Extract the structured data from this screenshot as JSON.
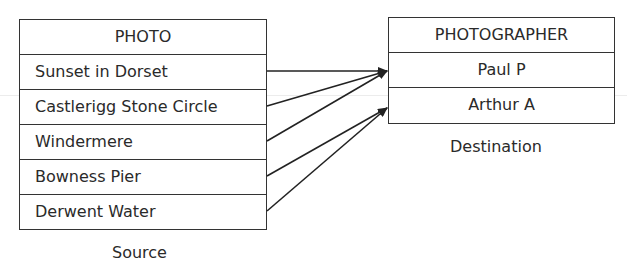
{
  "source": {
    "title": "PHOTO",
    "rows": [
      "Sunset in Dorset",
      "Castlerigg Stone Circle",
      "Windermere",
      "Bowness Pier",
      "Derwent Water"
    ],
    "caption": "Source"
  },
  "destination": {
    "title": "PHOTOGRAPHER",
    "rows": [
      "Paul P",
      "Arthur A"
    ],
    "caption": "Destination"
  },
  "mappings": [
    {
      "from": "Sunset in Dorset",
      "to": "Paul P"
    },
    {
      "from": "Castlerigg Stone Circle",
      "to": "Paul P"
    },
    {
      "from": "Windermere",
      "to": "Paul P"
    },
    {
      "from": "Bowness Pier",
      "to": "Arthur A"
    },
    {
      "from": "Derwent Water",
      "to": "Arthur A"
    }
  ],
  "colors": {
    "line": "#222222",
    "border": "#333333",
    "text": "#2a2a2a"
  }
}
